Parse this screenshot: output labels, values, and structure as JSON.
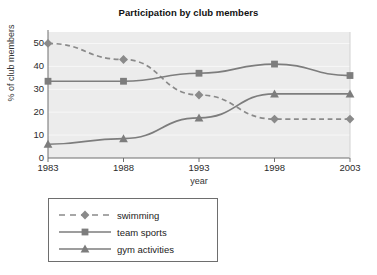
{
  "chart_data": {
    "type": "line",
    "title": "Participation by club members",
    "xlabel": "year",
    "ylabel": "% of club members",
    "categories": [
      "1983",
      "1988",
      "1993",
      "1998",
      "2003"
    ],
    "ylim": [
      0,
      55
    ],
    "yticks": [
      "0",
      "10",
      "20",
      "30",
      "40",
      "50"
    ],
    "grid": true,
    "legend_position": "below-plot-left",
    "series": [
      {
        "name": "swimming",
        "marker": "diamond",
        "linestyle": "dashed",
        "color": "#8a8a8a",
        "values": [
          50,
          43,
          27.5,
          17,
          17
        ]
      },
      {
        "name": "team sports",
        "marker": "square",
        "linestyle": "solid",
        "color": "#7d7d7d",
        "values": [
          33.5,
          33.5,
          37,
          41,
          36
        ]
      },
      {
        "name": "gym activities",
        "marker": "triangle",
        "linestyle": "solid",
        "color": "#7d7d7d",
        "values": [
          6,
          8.5,
          17.5,
          28,
          28
        ]
      }
    ]
  },
  "plot": {
    "background_color": "#ececec",
    "axis_color": "#6e6e6e",
    "gridline_color": "#f7f7f7"
  },
  "legend": {
    "items": [
      {
        "label": "swimming"
      },
      {
        "label": "team sports"
      },
      {
        "label": "gym activities"
      }
    ]
  }
}
